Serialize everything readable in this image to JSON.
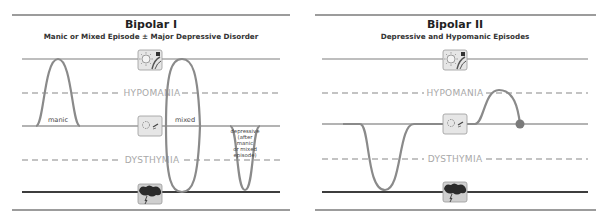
{
  "colors": {
    "rule": "#3a3a3a",
    "mania_line": "#a9a9a9",
    "baseline": "#9a9a9a",
    "depression_line": "#3d3d3d",
    "dashed": "#b0b0b0",
    "mood_curve": "#8a8a8a",
    "endpoint": "#7a7a7a",
    "icon_bg": "#e6e6e6",
    "icon_border": "#999999"
  },
  "panels": [
    {
      "title": "Bipolar I",
      "subtitle": "Manic or Mixed Episode ± Major Depressive Disorder",
      "bands": {
        "hypomania": "HYPOMANIA",
        "dysthymia": "DYSTHYMIA"
      },
      "icons": {
        "top": "sun-and-music-icon",
        "middle": "sun-and-music-outline-icon",
        "bottom": "storm-cloud-icon"
      },
      "episodes": [
        {
          "label": "manic",
          "type": "mania"
        },
        {
          "label": "mixed",
          "type": "mixed"
        },
        {
          "label_lines": [
            "depressive",
            "(after",
            "manic",
            "or mixed",
            "episode)"
          ],
          "type": "depression"
        }
      ]
    },
    {
      "title": "Bipolar II",
      "subtitle": "Depressive and Hypomanic Episodes",
      "bands": {
        "hypomania": "HYPOMANIA",
        "dysthymia": "DYSTHYMIA"
      },
      "icons": {
        "top": "sun-and-music-icon",
        "middle": "sun-and-music-outline-icon",
        "bottom": "storm-cloud-icon"
      },
      "episodes": [
        {
          "type": "depression"
        },
        {
          "type": "hypomania"
        }
      ]
    }
  ]
}
